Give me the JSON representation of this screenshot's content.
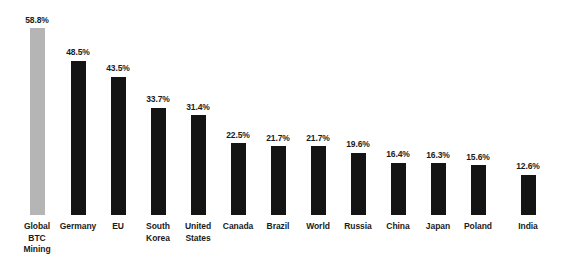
{
  "chart_data": {
    "type": "bar",
    "title": "",
    "subtitle": "",
    "xlabel": "",
    "ylabel": "",
    "ylim": [
      0,
      58.8
    ],
    "grid": false,
    "legend": "none",
    "value_suffix": "%",
    "categories": [
      "Global BTC Mining",
      "Germany",
      "EU",
      "South Korea",
      "United States",
      "Canada",
      "Brazil",
      "World",
      "Russia",
      "China",
      "Japan",
      "Poland",
      "India"
    ],
    "values": [
      58.8,
      48.5,
      43.5,
      33.7,
      31.4,
      22.5,
      21.7,
      21.7,
      19.6,
      16.4,
      16.3,
      15.6,
      12.6
    ],
    "data_labels": [
      "58.8%",
      "48.5%",
      "43.5%",
      "33.7%",
      "31.4%",
      "22.5%",
      "21.7%",
      "21.7%",
      "19.6%",
      "16.4%",
      "16.3%",
      "15.6%",
      "12.6%"
    ],
    "category_lines": [
      [
        "Global",
        "BTC",
        "Mining"
      ],
      [
        "Germany"
      ],
      [
        "EU"
      ],
      [
        "South",
        "Korea"
      ],
      [
        "United",
        "States"
      ],
      [
        "Canada"
      ],
      [
        "Brazil"
      ],
      [
        "World"
      ],
      [
        "Russia"
      ],
      [
        "China"
      ],
      [
        "Japan"
      ],
      [
        "Poland"
      ],
      [
        "India"
      ]
    ],
    "highlight_index": 0,
    "colors": {
      "bar": "#141414",
      "highlight_bar": "#b5b5b5",
      "text": "#1b1b1b",
      "background": "#ffffff"
    },
    "layout": {
      "baseline_y": 215,
      "max_bar_height": 187,
      "bar_width": 15,
      "bar_centers": [
        37,
        78,
        118,
        158,
        198,
        238,
        278,
        318,
        358,
        398,
        438,
        478,
        528
      ]
    }
  }
}
